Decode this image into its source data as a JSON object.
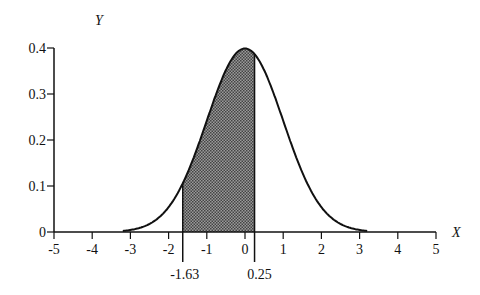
{
  "chart_data": {
    "type": "area",
    "title": "",
    "xlabel": "X",
    "ylabel": "Y",
    "xlim": [
      -5,
      5
    ],
    "ylim": [
      0,
      0.4
    ],
    "x_ticks": [
      "-5",
      "-4",
      "-3",
      "-2",
      "-1",
      "0",
      "1",
      "2",
      "3",
      "4",
      "5"
    ],
    "y_ticks": [
      "0",
      "0.1",
      "0.2",
      "0.3",
      "0.4"
    ],
    "series": [
      {
        "name": "Standard normal density",
        "mean": 0,
        "sd": 1,
        "x_range": [
          -3.2,
          3.2
        ]
      }
    ],
    "shaded_region": {
      "from": -1.63,
      "to": 0.25
    },
    "annotations": [
      "-1.63",
      "0.25"
    ],
    "grid": false,
    "legend": "none"
  },
  "colors": {
    "line": "#111111",
    "shade": "#6a6a6a"
  }
}
